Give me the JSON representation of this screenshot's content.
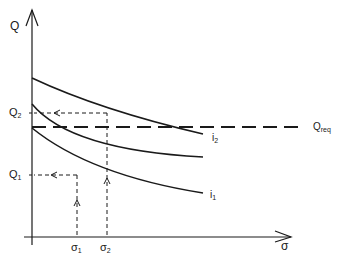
{
  "diagram": {
    "y_axis_label": "Q",
    "x_axis_label": "σ",
    "y_ticks": [
      {
        "base": "Q",
        "sub": "2"
      },
      {
        "base": "Q",
        "sub": "1"
      }
    ],
    "x_ticks": [
      {
        "base": "σ",
        "sub": "1"
      },
      {
        "base": "σ",
        "sub": "2"
      }
    ],
    "required_line": {
      "base": "Q",
      "sub": "req"
    },
    "curves": [
      {
        "base": "i",
        "sub": "2"
      },
      {
        "base": "",
        "sub": ""
      },
      {
        "base": "i",
        "sub": "1"
      }
    ],
    "colors": {
      "ink": "#1a1a1a",
      "background": "#ffffff"
    }
  }
}
